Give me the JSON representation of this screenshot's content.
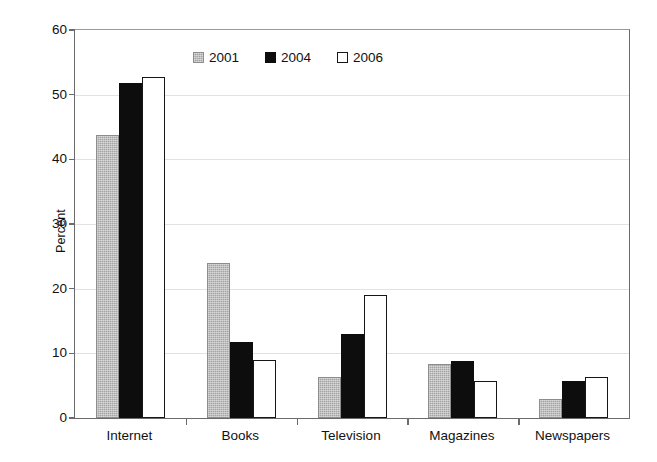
{
  "chart_data": {
    "type": "bar",
    "title": "",
    "subtitle": "",
    "xlabel": "",
    "ylabel": "Percent",
    "categories": [
      "Internet",
      "Books",
      "Television",
      "Magazines",
      "Newspapers"
    ],
    "series": [
      {
        "name": "2001",
        "color": "#a3a3a3",
        "values": [
          43.8,
          23.9,
          6.3,
          8.3,
          2.9
        ]
      },
      {
        "name": "2004",
        "color": "#0d0d0d",
        "values": [
          51.8,
          11.8,
          13.0,
          8.8,
          5.8
        ]
      },
      {
        "name": "2006",
        "color": "#ffffff",
        "values": [
          52.7,
          8.9,
          19.0,
          5.8,
          6.4
        ]
      }
    ],
    "ylim": [
      0,
      60
    ],
    "yticks": [
      0,
      10,
      20,
      30,
      40,
      50,
      60
    ],
    "ytick_labels": [
      "0",
      "10",
      "20",
      "30",
      "40",
      "50",
      "60"
    ],
    "grid": true,
    "grid_axis": "y",
    "legend_position": "top-center",
    "legend_entries": [
      "2001",
      "2004",
      "2006"
    ],
    "annotations": []
  },
  "axes": {
    "y_title": "Percent"
  }
}
